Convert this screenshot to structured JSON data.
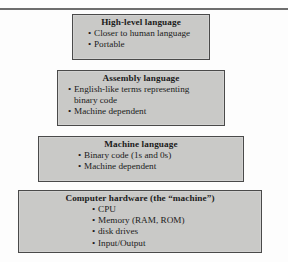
{
  "figure": {
    "type": "3d-stacked-pyramid-diagram",
    "colors": {
      "front_face": "#c9c9c7",
      "top_face": "#8a8a88",
      "side_face": "#9a9a98",
      "outline": "#4a4a4a",
      "rule": "#6e6e6e",
      "text": "#1b1b1b",
      "background": "#fdfdfd"
    },
    "layers": [
      {
        "id": "high-level-language",
        "title": "High-level language",
        "bullets": [
          "Closer to human language",
          "Portable"
        ]
      },
      {
        "id": "assembly-language",
        "title": "Assembly language",
        "bullets": [
          "English-like terms representing",
          "binary code",
          "Machine dependent"
        ],
        "bullet_flags": [
          true,
          false,
          true
        ]
      },
      {
        "id": "machine-language",
        "title": "Machine language",
        "bullets": [
          "Binary code (1s and 0s)",
          "Machine dependent"
        ]
      },
      {
        "id": "computer-hardware",
        "title": "Computer hardware (the “machine”)",
        "bullets": [
          "CPU",
          "Memory (RAM, ROM)",
          "disk drives",
          "Input/Output"
        ]
      }
    ]
  }
}
